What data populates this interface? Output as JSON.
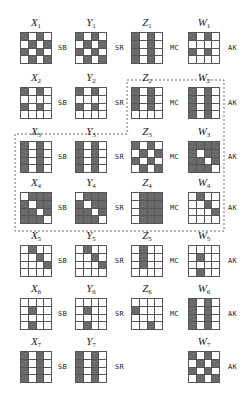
{
  "diagram": {
    "columns": [
      "X",
      "Y",
      "Z",
      "W"
    ],
    "operations": [
      "SB",
      "SR",
      "MC",
      "AK"
    ],
    "highlight": "dashed region enclosing Z2, W2, X3–W3, X4–W4",
    "rounds": [
      {
        "index": "1",
        "X": [
          "1010",
          "0101",
          "1010",
          "0101"
        ],
        "Y": [
          "1010",
          "0101",
          "1010",
          "0101"
        ],
        "Z": [
          "1010",
          "1010",
          "1010",
          "1010"
        ],
        "W": [
          "1010",
          "0000",
          "1010",
          "0000"
        ],
        "ops": [
          "SB",
          "SR",
          "MC",
          "AK"
        ]
      },
      {
        "index": "2",
        "X": [
          "1010",
          "0000",
          "1010",
          "0000"
        ],
        "Y": [
          "1010",
          "0000",
          "1010",
          "0000"
        ],
        "Z": [
          "1010",
          "1010",
          "1010",
          "0000"
        ],
        "W": [
          "1010",
          "1010",
          "1010",
          "1010"
        ],
        "ops": [
          "SB",
          "SR",
          "MC",
          "AK"
        ]
      },
      {
        "index": "3",
        "X": [
          "1010",
          "1010",
          "1010",
          "1010"
        ],
        "Y": [
          "1010",
          "1010",
          "1010",
          "1010"
        ],
        "Z": [
          "1010",
          "0101",
          "1010",
          "0101"
        ],
        "W": [
          "1111",
          "1011",
          "1101",
          "1110"
        ],
        "ops": [
          "SB",
          "SR",
          "MC",
          "AK"
        ]
      },
      {
        "index": "4",
        "X": [
          "0111",
          "1011",
          "1101",
          "1110"
        ],
        "Y": [
          "0111",
          "1011",
          "1101",
          "1110"
        ],
        "Z": [
          "0111",
          "0111",
          "0111",
          "0111"
        ],
        "W": [
          "0100",
          "0010",
          "0001",
          "0000"
        ],
        "ops": [
          "SB",
          "SR",
          "MC",
          "AK"
        ]
      },
      {
        "index": "5",
        "X": [
          "0100",
          "0010",
          "0001",
          "0000"
        ],
        "Y": [
          "0100",
          "0010",
          "0001",
          "0000"
        ],
        "Z": [
          "0100",
          "0100",
          "0100",
          "0000"
        ],
        "W": [
          "0000",
          "0100",
          "0000",
          "0100"
        ],
        "ops": [
          "SB",
          "SR",
          "MC",
          "AK"
        ]
      },
      {
        "index": "6",
        "X": [
          "0000",
          "0100",
          "0000",
          "0100"
        ],
        "Y": [
          "0000",
          "0100",
          "0000",
          "0100"
        ],
        "Z": [
          "0000",
          "1000",
          "0000",
          "0010"
        ],
        "W": [
          "1010",
          "1010",
          "1010",
          "1010"
        ],
        "ops": [
          "SB",
          "SR",
          "MC",
          "AK"
        ]
      },
      {
        "index": "7",
        "X": [
          "1010",
          "1010",
          "1010",
          "1010"
        ],
        "Y": [
          "1010",
          "1010",
          "1010",
          "1010"
        ],
        "Z": null,
        "W": [
          "1010",
          "0101",
          "1010",
          "0101"
        ],
        "ops": [
          "SB",
          "SR",
          "",
          "AK"
        ]
      }
    ]
  }
}
